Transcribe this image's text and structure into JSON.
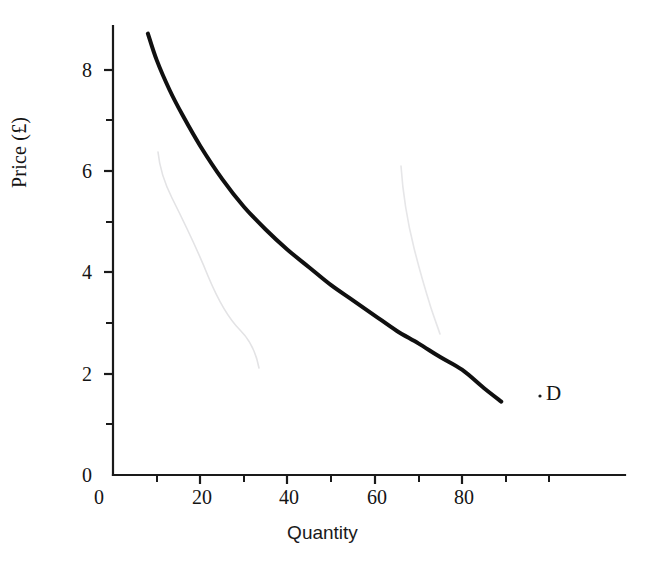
{
  "chart_data": {
    "type": "line",
    "title": "",
    "subtitle": "",
    "xlabel": "Quantity",
    "ylabel": "Price (£)",
    "xlim": [
      0,
      117
    ],
    "ylim": [
      0,
      8.9
    ],
    "grid": false,
    "legend_position": "none",
    "x_ticks_major": [
      0,
      20,
      40,
      60,
      80
    ],
    "x_ticks_major_labels": [
      "0",
      "20",
      "40",
      "60",
      "80"
    ],
    "x_ticks_minor": [
      10,
      30,
      50,
      70,
      90
    ],
    "y_ticks_major": [
      0,
      2,
      4,
      6,
      8
    ],
    "y_ticks_major_labels": [
      "0",
      "2",
      "4",
      "6",
      "8"
    ],
    "y_ticks_minor": [
      1,
      3,
      5,
      7
    ],
    "series": [
      {
        "name": "D",
        "label": "D",
        "kind": "demand-curve",
        "color": "#101010",
        "linewidth": 4,
        "x": [
          8,
          10,
          13,
          16,
          20,
          25,
          30,
          35,
          40,
          45,
          50,
          55,
          60,
          65,
          70,
          75,
          80,
          85,
          89
        ],
        "y": [
          8.72,
          8.2,
          7.6,
          7.1,
          6.5,
          5.85,
          5.3,
          4.85,
          4.45,
          4.1,
          3.75,
          3.45,
          3.15,
          2.85,
          2.6,
          2.33,
          2.08,
          1.72,
          1.45
        ]
      }
    ],
    "annotations": [
      {
        "name": "series-end-label",
        "text": "D",
        "x": 92,
        "y": 1.45
      }
    ],
    "artifacts": [
      {
        "name": "scan-crease-left",
        "color": "#e2e2e4"
      },
      {
        "name": "scan-crease-right",
        "color": "#e6e6e8"
      }
    ]
  },
  "axes": {
    "axis_color": "#1a1a1a",
    "axis_linewidth": 2
  },
  "colors": {
    "background": "#ffffff",
    "ink": "#141414",
    "curve": "#101010",
    "faint": "#e4e4e6"
  }
}
